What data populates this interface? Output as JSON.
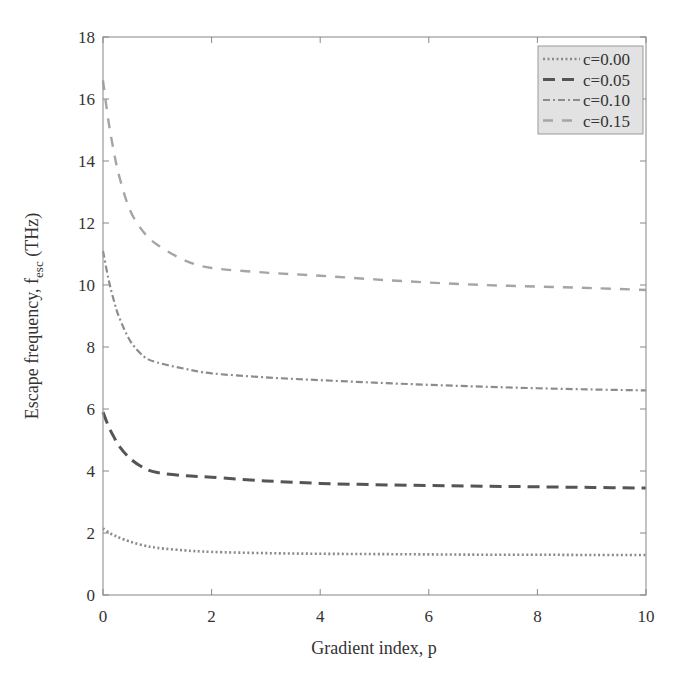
{
  "chart_data": {
    "type": "line",
    "title": "",
    "xlabel": "Gradient index, p",
    "ylabel_main": "Escape frequency, f",
    "ylabel_sub": "esc",
    "ylabel_unit": "(THz)",
    "xlim": [
      0,
      10
    ],
    "ylim": [
      0,
      18
    ],
    "xticks": [
      0,
      2,
      4,
      6,
      8,
      10
    ],
    "yticks": [
      0,
      2,
      4,
      6,
      8,
      10,
      12,
      14,
      16,
      18
    ],
    "grid": false,
    "legend_position": "upper right",
    "x": [
      0,
      0.1,
      0.2,
      0.3,
      0.5,
      0.75,
      1,
      1.5,
      2,
      3,
      4,
      5,
      6,
      7,
      8,
      9,
      10
    ],
    "series": [
      {
        "name": "c=0.00",
        "style": "dotted",
        "color": "#8a8a8a",
        "values": [
          2.15,
          2.02,
          1.93,
          1.85,
          1.72,
          1.6,
          1.52,
          1.44,
          1.39,
          1.35,
          1.33,
          1.32,
          1.31,
          1.3,
          1.3,
          1.29,
          1.29
        ]
      },
      {
        "name": "c=0.05",
        "style": "dashed",
        "color": "#555555",
        "values": [
          5.9,
          5.45,
          5.1,
          4.8,
          4.4,
          4.1,
          3.95,
          3.85,
          3.8,
          3.68,
          3.6,
          3.56,
          3.53,
          3.51,
          3.49,
          3.47,
          3.45
        ]
      },
      {
        "name": "c=0.10",
        "style": "dashdot",
        "color": "#8c8c8c",
        "values": [
          11.1,
          10.2,
          9.5,
          8.95,
          8.2,
          7.7,
          7.5,
          7.3,
          7.15,
          7.02,
          6.93,
          6.85,
          6.78,
          6.72,
          6.67,
          6.63,
          6.6
        ]
      },
      {
        "name": "c=0.15",
        "style": "longdash",
        "color": "#a5a5a5",
        "values": [
          16.6,
          15.3,
          14.3,
          13.5,
          12.4,
          11.7,
          11.3,
          10.8,
          10.55,
          10.4,
          10.3,
          10.18,
          10.08,
          10.0,
          9.95,
          9.9,
          9.84
        ]
      }
    ]
  },
  "legend": {
    "background": "#e2e2e2",
    "entries": [
      "c=0.00",
      "c=0.05",
      "c=0.10",
      "c=0.15"
    ]
  }
}
